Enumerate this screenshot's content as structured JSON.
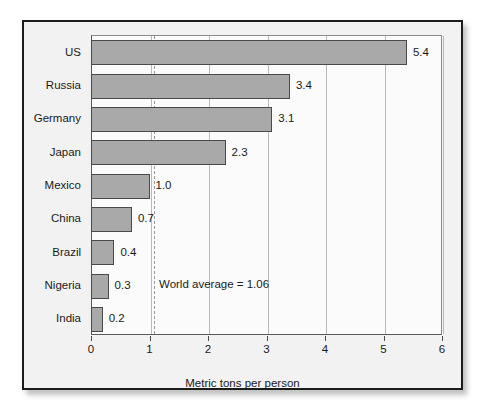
{
  "chart_data": {
    "type": "bar",
    "orientation": "horizontal",
    "title": "",
    "xlabel": "Metric tons per person",
    "ylabel": "",
    "xlim": [
      0,
      6
    ],
    "xticks": [
      "0",
      "1",
      "2",
      "3",
      "4",
      "5",
      "6"
    ],
    "grid": "vertical",
    "legend": "none",
    "categories": [
      "US",
      "Russia",
      "Germany",
      "Japan",
      "Mexico",
      "China",
      "Brazil",
      "Nigeria",
      "India"
    ],
    "values": [
      5.4,
      3.4,
      3.1,
      2.3,
      1.0,
      0.7,
      0.4,
      0.3,
      0.2
    ],
    "value_labels": [
      "5.4",
      "3.4",
      "3.1",
      "2.3",
      "1.0",
      "0.7",
      "0.4",
      "0.3",
      "0.2"
    ],
    "annotations": [
      {
        "id": "world-average",
        "text": "World average = 1.06",
        "value": 1.06,
        "line_style": "dashed"
      }
    ],
    "colors": {
      "bar_fill": "#a9a9a9",
      "bar_stroke": "#4a4a4a",
      "plot_background": "#fbfbfb",
      "panel_background": "#f2f2f2",
      "panel_border": "#1c1c1c",
      "gridline": "#b9b9b9",
      "average_line": "#9a9a9a",
      "text": "#1a1a1a"
    }
  }
}
